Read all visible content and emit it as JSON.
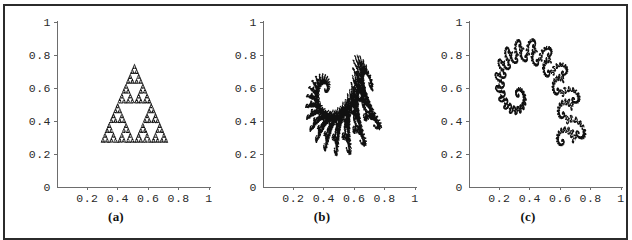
{
  "figure": {
    "panel_count": 3,
    "border_color": "#2b2b2b",
    "background": "#ffffff",
    "ink_color": "#101010",
    "axis_color": "#6d6d6d"
  },
  "axes": {
    "x_ticks": [
      "0.2",
      "0.4",
      "0.6",
      "0.8",
      "1"
    ],
    "x_tick_values": [
      0.2,
      0.4,
      0.6,
      0.8,
      1.0
    ],
    "y_ticks": [
      "0.2",
      "0.4",
      "0.6",
      "0.8",
      "1"
    ],
    "y_tick_values": [
      0.2,
      0.4,
      0.6,
      0.8,
      1.0
    ],
    "origin_label": "0",
    "xlim": [
      0,
      1
    ],
    "ylim": [
      0,
      1
    ]
  },
  "panels": [
    {
      "id": "a",
      "caption": "(a)",
      "name": "sierpinski-triangle-attractor",
      "render": "points",
      "point_count": 9000,
      "dot_radius": 0.33,
      "bounds": {
        "xmin": 0.29,
        "xmax": 0.73,
        "ymin": 0.27,
        "ymax": 0.745
      },
      "ifs": [
        {
          "a": 0.5,
          "b": 0.0,
          "c": 0.0,
          "d": 0.5,
          "e": 0.29,
          "f": 0.27,
          "p": 0.3334
        },
        {
          "a": 0.5,
          "b": 0.0,
          "c": 0.0,
          "d": 0.5,
          "e": 0.51,
          "f": 0.27,
          "p": 0.3333
        },
        {
          "a": 0.5,
          "b": 0.0,
          "c": 0.0,
          "d": 0.5,
          "e": 0.4,
          "f": 0.5075,
          "p": 0.3333
        }
      ]
    },
    {
      "id": "b",
      "caption": "(b)",
      "name": "dragon-curve-attractor",
      "render": "points",
      "point_count": 14000,
      "dot_radius": 0.62,
      "bounds": {
        "xmin": 0.28,
        "xmax": 0.78,
        "ymin": 0.19,
        "ymax": 0.8
      },
      "ifs": [
        {
          "a": 0.824074,
          "b": 0.281482,
          "c": -0.212346,
          "d": 0.864198,
          "e": 0.0854,
          "f": 0.1025,
          "p": 0.787473
        },
        {
          "a": 0.088272,
          "b": 0.520988,
          "c": -0.463889,
          "d": -0.377778,
          "e": 0.4896,
          "f": 0.2253,
          "p": 0.212527
        }
      ]
    },
    {
      "id": "c",
      "caption": "(c)",
      "name": "spiral-fern-attractor",
      "render": "points",
      "point_count": 16000,
      "dot_radius": 0.5,
      "bounds": {
        "xmin": 0.17,
        "xmax": 0.77,
        "ymin": 0.25,
        "ymax": 0.9
      },
      "ifs": [
        {
          "a": 0.787879,
          "b": -0.424242,
          "c": 0.242424,
          "d": 0.859848,
          "e": 0.1538,
          "f": 0.0855,
          "p": 0.895652
        },
        {
          "a": -0.121212,
          "b": 0.257576,
          "c": 0.151515,
          "d": 0.05303,
          "e": 0.4127,
          "f": 0.2042,
          "p": 0.052174
        },
        {
          "a": 0.181818,
          "b": -0.136364,
          "c": 0.090909,
          "d": 0.181818,
          "e": 0.4379,
          "f": 0.0995,
          "p": 0.052174
        }
      ]
    }
  ]
}
